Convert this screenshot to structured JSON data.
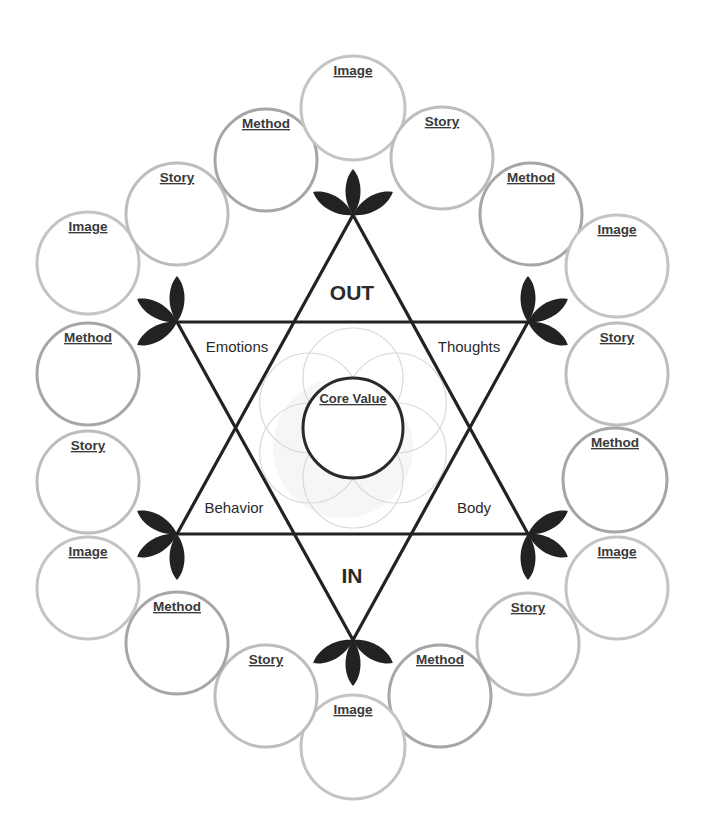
{
  "diagram": {
    "center": {
      "x": 353,
      "y": 428
    },
    "core": {
      "label": "Core Value",
      "radius": 50
    },
    "axis_labels": {
      "out": "OUT",
      "in": "IN"
    },
    "regions": {
      "emotions": "Emotions",
      "thoughts": "Thoughts",
      "behavior": "Behavior",
      "body": "Body"
    },
    "vertices": [
      {
        "name": "top",
        "x": 353,
        "y": 215,
        "leaf_angles": [
          -90,
          -150,
          -30
        ]
      },
      {
        "name": "upper-right",
        "x": 528,
        "y": 322,
        "leaf_angles": [
          -90,
          -30,
          30
        ]
      },
      {
        "name": "lower-right",
        "x": 528,
        "y": 534,
        "leaf_angles": [
          -30,
          30,
          90
        ]
      },
      {
        "name": "bottom",
        "x": 353,
        "y": 640,
        "leaf_angles": [
          90,
          150,
          30
        ]
      },
      {
        "name": "lower-left",
        "x": 177,
        "y": 534,
        "leaf_angles": [
          -150,
          150,
          90
        ]
      },
      {
        "name": "upper-left",
        "x": 177,
        "y": 322,
        "leaf_angles": [
          -90,
          -150,
          150
        ]
      }
    ],
    "circles": [
      {
        "label": "Method",
        "x": 266,
        "y": 160,
        "r": 51,
        "stroke": "#a6a6a6"
      },
      {
        "label": "Image",
        "x": 353,
        "y": 108,
        "r": 52,
        "stroke": "#c4c4c4"
      },
      {
        "label": "Story",
        "x": 442,
        "y": 158,
        "r": 51,
        "stroke": "#bdbdbd"
      },
      {
        "label": "Method",
        "x": 531,
        "y": 214,
        "r": 51,
        "stroke": "#a6a6a6"
      },
      {
        "label": "Image",
        "x": 617,
        "y": 266,
        "r": 51,
        "stroke": "#c4c4c4"
      },
      {
        "label": "Story",
        "x": 617,
        "y": 374,
        "r": 51,
        "stroke": "#bdbdbd"
      },
      {
        "label": "Method",
        "x": 615,
        "y": 480,
        "r": 52,
        "stroke": "#a6a6a6"
      },
      {
        "label": "Image",
        "x": 617,
        "y": 588,
        "r": 51,
        "stroke": "#c4c4c4"
      },
      {
        "label": "Story",
        "x": 528,
        "y": 644,
        "r": 51,
        "stroke": "#bdbdbd"
      },
      {
        "label": "Method",
        "x": 440,
        "y": 696,
        "r": 51,
        "stroke": "#a6a6a6"
      },
      {
        "label": "Image",
        "x": 353,
        "y": 747,
        "r": 52,
        "stroke": "#c4c4c4"
      },
      {
        "label": "Story",
        "x": 266,
        "y": 696,
        "r": 51,
        "stroke": "#bdbdbd"
      },
      {
        "label": "Method",
        "x": 177,
        "y": 643,
        "r": 51,
        "stroke": "#a6a6a6"
      },
      {
        "label": "Image",
        "x": 88,
        "y": 588,
        "r": 51,
        "stroke": "#c4c4c4"
      },
      {
        "label": "Story",
        "x": 88,
        "y": 482,
        "r": 51,
        "stroke": "#bdbdbd"
      },
      {
        "label": "Method",
        "x": 88,
        "y": 374,
        "r": 51,
        "stroke": "#a6a6a6"
      },
      {
        "label": "Image",
        "x": 88,
        "y": 263,
        "r": 51,
        "stroke": "#c4c4c4"
      },
      {
        "label": "Story",
        "x": 177,
        "y": 214,
        "r": 51,
        "stroke": "#bdbdbd"
      }
    ],
    "colors": {
      "line": "#222222",
      "leaf": "#222222",
      "text": "#2b2b2b",
      "flower": "#d8d8d8"
    }
  }
}
